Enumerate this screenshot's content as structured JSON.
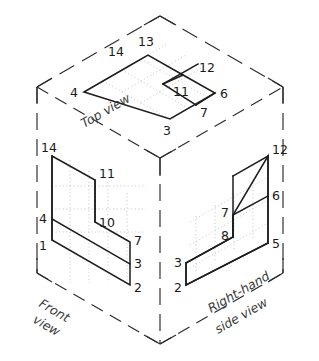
{
  "figure": {
    "type": "engineering-drawing",
    "background_color": "#ffffff",
    "line_color": "#1d1d1d",
    "construction_line_color": "#b9b9b9"
  },
  "view_labels": {
    "top": "Top view",
    "front_line1": "Front",
    "front_line2": "view",
    "side_line1": "Right-hand",
    "side_line2": "side view"
  },
  "vertex_labels": {
    "top_view": [
      {
        "id": "14",
        "text": "14"
      },
      {
        "id": "13",
        "text": "13"
      },
      {
        "id": "12",
        "text": "12"
      },
      {
        "id": "11",
        "text": "11"
      },
      {
        "id": "4",
        "text": "4"
      },
      {
        "id": "6",
        "text": "6"
      },
      {
        "id": "7",
        "text": "7"
      },
      {
        "id": "3",
        "text": "3"
      }
    ],
    "front_view": [
      {
        "id": "14",
        "text": "14"
      },
      {
        "id": "11",
        "text": "11"
      },
      {
        "id": "10",
        "text": "10"
      },
      {
        "id": "4",
        "text": "4"
      },
      {
        "id": "1",
        "text": "1"
      },
      {
        "id": "7",
        "text": "7"
      },
      {
        "id": "3",
        "text": "3"
      },
      {
        "id": "2",
        "text": "2"
      }
    ],
    "side_view": [
      {
        "id": "12",
        "text": "12"
      },
      {
        "id": "6",
        "text": "6"
      },
      {
        "id": "7",
        "text": "7"
      },
      {
        "id": "8",
        "text": "8"
      },
      {
        "id": "5",
        "text": "5"
      },
      {
        "id": "3",
        "text": "3"
      },
      {
        "id": "2",
        "text": "2"
      }
    ]
  }
}
